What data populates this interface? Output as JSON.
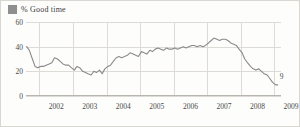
{
  "legend": {
    "swatch_name": "legend-color-swatch",
    "swatch_color": "#8f8f8f",
    "label": "% Good time"
  },
  "chart_data": {
    "type": "line",
    "title": "",
    "subtitle": "",
    "xlabel": "",
    "ylabel": "",
    "grid": true,
    "legend_position": "top-left",
    "xlim": [
      2001.6,
      2009.2
    ],
    "ylim": [
      0,
      60
    ],
    "yticks": [
      0,
      20,
      40,
      60
    ],
    "ytick_labels": [
      "0",
      "20",
      "40",
      "60"
    ],
    "xticks": [
      2002,
      2003,
      2004,
      2005,
      2006,
      2007,
      2008,
      2009
    ],
    "xtick_labels": [
      "2002",
      "2003",
      "2004",
      "2005",
      "2006",
      "2007",
      "2008",
      "2009"
    ],
    "series": [
      {
        "name": "% Good time",
        "color": "#8a8a8a",
        "end_label": "9",
        "x": [
          2001.62,
          2001.7,
          2001.79,
          2001.87,
          2001.95,
          2002.04,
          2002.12,
          2002.2,
          2002.29,
          2002.37,
          2002.45,
          2002.54,
          2002.62,
          2002.7,
          2002.79,
          2002.87,
          2002.95,
          2003.04,
          2003.12,
          2003.2,
          2003.29,
          2003.37,
          2003.45,
          2003.54,
          2003.62,
          2003.7,
          2003.79,
          2003.87,
          2003.95,
          2004.04,
          2004.12,
          2004.2,
          2004.29,
          2004.37,
          2004.45,
          2004.54,
          2004.62,
          2004.7,
          2004.79,
          2004.87,
          2004.95,
          2005.04,
          2005.12,
          2005.2,
          2005.29,
          2005.37,
          2005.45,
          2005.54,
          2005.62,
          2005.7,
          2005.79,
          2005.87,
          2005.95,
          2006.04,
          2006.12,
          2006.2,
          2006.29,
          2006.37,
          2006.45,
          2006.54,
          2006.62,
          2006.7,
          2006.79,
          2006.87,
          2006.95,
          2007.04,
          2007.12,
          2007.2,
          2007.29,
          2007.37,
          2007.45,
          2007.54,
          2007.62,
          2007.7,
          2007.79,
          2007.87,
          2007.95,
          2008.04,
          2008.12,
          2008.2,
          2008.29,
          2008.37,
          2008.45,
          2008.54,
          2008.62,
          2008.7,
          2008.79,
          2008.87,
          2008.95,
          2009.04,
          2009.1
        ],
        "values": [
          40,
          37,
          30,
          24,
          23,
          24,
          24,
          25,
          26,
          27,
          31,
          30,
          28,
          26,
          25,
          25,
          23,
          21,
          24,
          23,
          20,
          19,
          18,
          17,
          20,
          19,
          21,
          18,
          22,
          24,
          25,
          28,
          31,
          32,
          31,
          32,
          33,
          35,
          34,
          33,
          32,
          36,
          35,
          34,
          37,
          36,
          38,
          39,
          38,
          37,
          39,
          38,
          38,
          39,
          38,
          39,
          40,
          39,
          40,
          41,
          41,
          40,
          41,
          40,
          41,
          43,
          45,
          47,
          46,
          45,
          46,
          46,
          45,
          43,
          42,
          41,
          38,
          35,
          30,
          27,
          24,
          22,
          21,
          22,
          20,
          18,
          17,
          14,
          11,
          9,
          9
        ]
      }
    ]
  }
}
